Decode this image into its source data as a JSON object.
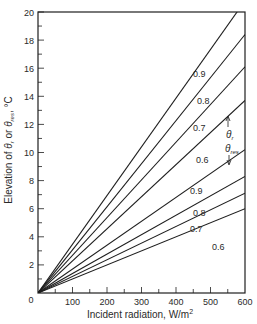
{
  "chart_data": {
    "type": "line",
    "title": "",
    "xlabel": "Incident radiation, W/m²",
    "ylabel": "Elevation of θr or θres, °C",
    "xlim": [
      0,
      600
    ],
    "ylim": [
      0,
      20
    ],
    "x_ticks": [
      0,
      100,
      200,
      300,
      400,
      500,
      600
    ],
    "x_tick_labels": [
      "0",
      "100",
      "200",
      "300",
      "400",
      "500",
      "600"
    ],
    "y_ticks": [
      2,
      4,
      6,
      8,
      10,
      12,
      14,
      16,
      18,
      20
    ],
    "y_tick_labels": [
      "2",
      "4",
      "6",
      "8",
      "10",
      "12",
      "14",
      "16",
      "18",
      "20"
    ],
    "grid": false,
    "legend": "none (inline labels)",
    "annotations": [
      {
        "text": "θr",
        "note": "arrow pointing up to upper group of lines"
      },
      {
        "text": "θres",
        "note": "arrow pointing down to lower group of lines"
      }
    ],
    "series": [
      {
        "name": "θr 0.9",
        "group": "θr",
        "label": "0.9",
        "x": [
          0,
          600
        ],
        "y": [
          0,
          20.8
        ]
      },
      {
        "name": "θr 0.8",
        "group": "θr",
        "label": "0.8",
        "x": [
          0,
          600
        ],
        "y": [
          0,
          18.4
        ]
      },
      {
        "name": "θr 0.7",
        "group": "θr",
        "label": "0.7",
        "x": [
          0,
          600
        ],
        "y": [
          0,
          16.1
        ]
      },
      {
        "name": "θr 0.6",
        "group": "θr",
        "label": "0.6",
        "x": [
          0,
          600
        ],
        "y": [
          0,
          13.7
        ]
      },
      {
        "name": "θres 0.9",
        "group": "θres",
        "label": "0.9",
        "x": [
          0,
          600
        ],
        "y": [
          0,
          10.2
        ]
      },
      {
        "name": "θres 0.8",
        "group": "θres",
        "label": "0.8",
        "x": [
          0,
          600
        ],
        "y": [
          0,
          8.3
        ]
      },
      {
        "name": "θres 0.7",
        "group": "θres",
        "label": "0.7",
        "x": [
          0,
          600
        ],
        "y": [
          0,
          7.1
        ]
      },
      {
        "name": "θres 0.6",
        "group": "θres",
        "label": "0.6",
        "x": [
          0,
          600
        ],
        "y": [
          0,
          6.0
        ]
      }
    ]
  },
  "labels": {
    "x_axis": "Incident radiation, W/m",
    "x_axis_sup": "2",
    "y_axis_prefix": "Elevation of ",
    "y_axis_theta": "θ",
    "y_axis_sub_r": "r",
    "y_axis_or": " or ",
    "y_axis_sub_res": "res",
    "y_axis_suffix": ", °C",
    "theta_r": "θ",
    "theta_r_sub": "r",
    "theta_res": "θ",
    "theta_res_sub": "res",
    "origin": "0"
  },
  "colors": {
    "line": "#1e1e1e",
    "axis": "#1e1e1e",
    "text": "#2a2a2a",
    "background": "#ffffff"
  }
}
